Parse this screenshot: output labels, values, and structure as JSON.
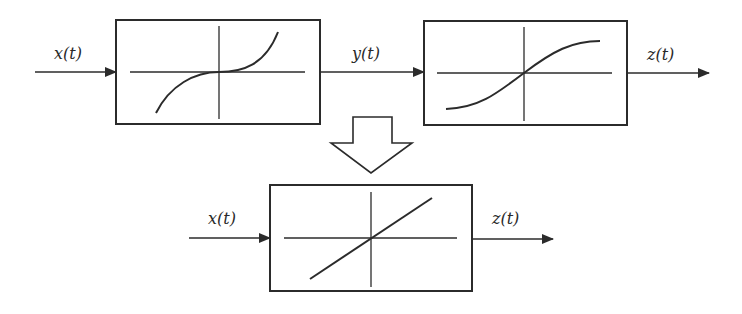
{
  "diagram": {
    "top_row": {
      "input_label": "x(t)",
      "intermediate_label": "y(t)",
      "output_label": "z(t)",
      "block1": {
        "name": "expansive-nonlinearity",
        "curve": "cubic"
      },
      "block2": {
        "name": "compressive-nonlinearity",
        "curve": "sigmoid"
      }
    },
    "transform_arrow": {
      "name": "equivalence-arrow",
      "direction": "down"
    },
    "bottom_row": {
      "input_label": "x(t)",
      "output_label": "z(t)",
      "block": {
        "name": "linear-equivalent",
        "curve": "linear"
      }
    },
    "colors": {
      "line": "#2b2b2b",
      "background": "#ffffff"
    }
  }
}
